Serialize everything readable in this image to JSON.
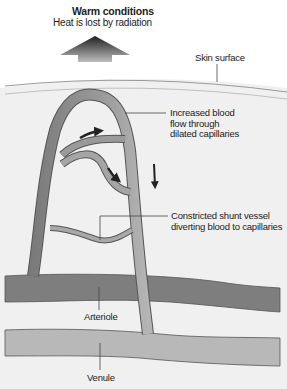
{
  "header": {
    "title": "Warm conditions",
    "subtitle": "Heat is lost by radiation"
  },
  "labels": {
    "skin_surface": "Skin surface",
    "increased_flow": [
      "Increased blood",
      "flow through",
      "dilated  capillaries"
    ],
    "shunt": [
      "Constricted shunt vessel",
      "diverting blood to capillaries"
    ],
    "arteriole": "Arteriole",
    "venule": "Venule"
  },
  "colors": {
    "background": "#ffffff",
    "dermis": "#efefef",
    "skin_line": "#9a9a9a",
    "arteriole": "#7d7d7d",
    "venule": "#b4b4b4",
    "vessel_outline": "#555555",
    "arrow": "#2a2a2a"
  }
}
